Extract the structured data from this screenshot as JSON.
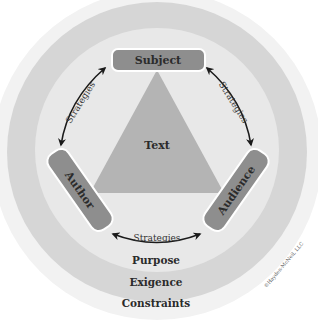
{
  "diagram": {
    "type": "rhetorical-situation-diagram",
    "center": {
      "label": "Text"
    },
    "nodes": {
      "top": {
        "label": "Subject"
      },
      "left": {
        "label": "Author"
      },
      "right": {
        "label": "Audience"
      }
    },
    "connectors": {
      "left": {
        "label": "Strategies"
      },
      "right": {
        "label": "Strategies"
      },
      "bottom": {
        "label": "Strategies"
      }
    },
    "rings": {
      "inner": {
        "label": "Purpose"
      },
      "middle": {
        "label": "Exigence"
      },
      "outer": {
        "label": "Constraints"
      }
    },
    "copyright": "©Hayden-McNeil, LLC",
    "colors": {
      "outer_disc": "#f1f1f1",
      "exigence_ring": "#d4d4d4",
      "inner_disc": "#e9e9e9",
      "triangle": "#b3b3b3",
      "node_fill": "#8e8e8e",
      "node_border": "#ffffff",
      "arrow": "#1a1a1a",
      "text": "#2b2b2b"
    }
  }
}
